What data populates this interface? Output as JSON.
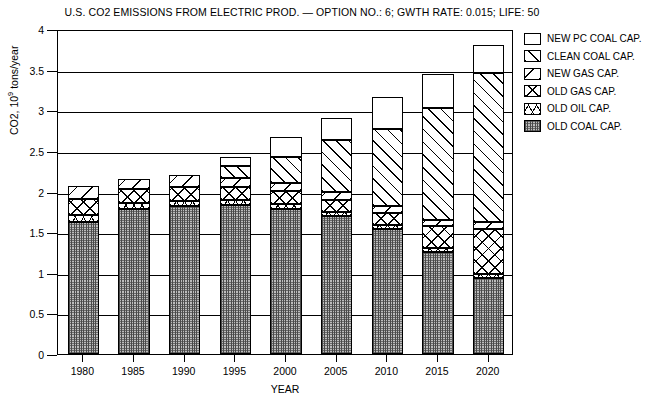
{
  "chart": {
    "title": "U.S. CO2 EMISSIONS FROM ELECTRIC PROD. — OPTION NO.: 6; GWTH RATE: 0.015; LIFE: 50",
    "xlabel": "YEAR",
    "ylabel_prefix": "CO2, 10",
    "ylabel_sup": "9",
    "ylabel_suffix": " tons/year"
  },
  "yticks": [
    "0",
    "0.5",
    "1",
    "1.5",
    "2",
    "2.5",
    "3",
    "3.5",
    "4"
  ],
  "legend": [
    {
      "label": "NEW PC COAL CAP.",
      "pattern": "p-newpc"
    },
    {
      "label": "CLEAN COAL CAP.",
      "pattern": "p-clean"
    },
    {
      "label": "NEW GAS CAP.",
      "pattern": "p-newgas"
    },
    {
      "label": "OLD GAS CAP.",
      "pattern": "p-oldgas"
    },
    {
      "label": "OLD OIL CAP.",
      "pattern": "p-oldoil"
    },
    {
      "label": "OLD COAL CAP.",
      "pattern": "p-oldcoal"
    }
  ],
  "chart_data": {
    "type": "bar",
    "subtype": "stacked",
    "title": "U.S. CO2 EMISSIONS FROM ELECTRIC PROD. — OPTION NO.: 6; GWTH RATE: 0.015; LIFE: 50",
    "xlabel": "YEAR",
    "ylabel": "CO2, 10^9 tons/year",
    "ylim": [
      0,
      4
    ],
    "ytick_step": 0.5,
    "grid": true,
    "legend_position": "right",
    "categories": [
      "1980",
      "1985",
      "1990",
      "1995",
      "2000",
      "2005",
      "2010",
      "2015",
      "2020"
    ],
    "series": [
      {
        "name": "OLD COAL CAP.",
        "pattern": "p-oldcoal",
        "values": [
          1.62,
          1.79,
          1.82,
          1.83,
          1.79,
          1.7,
          1.54,
          1.26,
          0.94
        ]
      },
      {
        "name": "OLD OIL CAP.",
        "pattern": "p-oldoil",
        "values": [
          0.09,
          0.07,
          0.06,
          0.06,
          0.06,
          0.05,
          0.05,
          0.05,
          0.05
        ]
      },
      {
        "name": "OLD GAS CAP.",
        "pattern": "p-oldgas",
        "values": [
          0.2,
          0.17,
          0.17,
          0.16,
          0.16,
          0.14,
          0.14,
          0.26,
          0.55
        ]
      },
      {
        "name": "NEW GAS CAP.",
        "pattern": "p-newgas",
        "values": [
          0.16,
          0.12,
          0.15,
          0.12,
          0.1,
          0.1,
          0.09,
          0.08,
          0.08
        ]
      },
      {
        "name": "CLEAN COAL CAP.",
        "pattern": "p-clean",
        "values": [
          0.0,
          0.0,
          0.0,
          0.15,
          0.32,
          0.64,
          0.95,
          1.38,
          1.84
        ]
      },
      {
        "name": "NEW PC COAL CAP.",
        "pattern": "p-newpc",
        "values": [
          0.0,
          0.0,
          0.0,
          0.1,
          0.24,
          0.27,
          0.39,
          0.42,
          0.34
        ]
      }
    ],
    "totals": [
      2.07,
      2.15,
      2.2,
      2.42,
      2.67,
      2.9,
      3.16,
      3.45,
      3.8
    ]
  }
}
